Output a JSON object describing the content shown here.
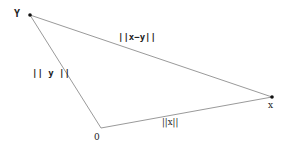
{
  "diagram": {
    "type": "triangle-vector-norms",
    "colors": {
      "background": "#ffffff",
      "line": "#9a9a9a",
      "text": "#222222",
      "vertex": "#111111"
    },
    "vertices": {
      "y": {
        "label": "Y",
        "x": 30,
        "y": 15
      },
      "origin": {
        "label": "0",
        "x": 101,
        "y": 128
      },
      "x": {
        "label": "x",
        "x": 272,
        "y": 97
      }
    },
    "edges": [
      {
        "from": "y",
        "to": "x",
        "label": "||x−y||"
      },
      {
        "from": "origin",
        "to": "y",
        "label": "|| y ||"
      },
      {
        "from": "origin",
        "to": "x",
        "label": "||x||"
      }
    ]
  }
}
